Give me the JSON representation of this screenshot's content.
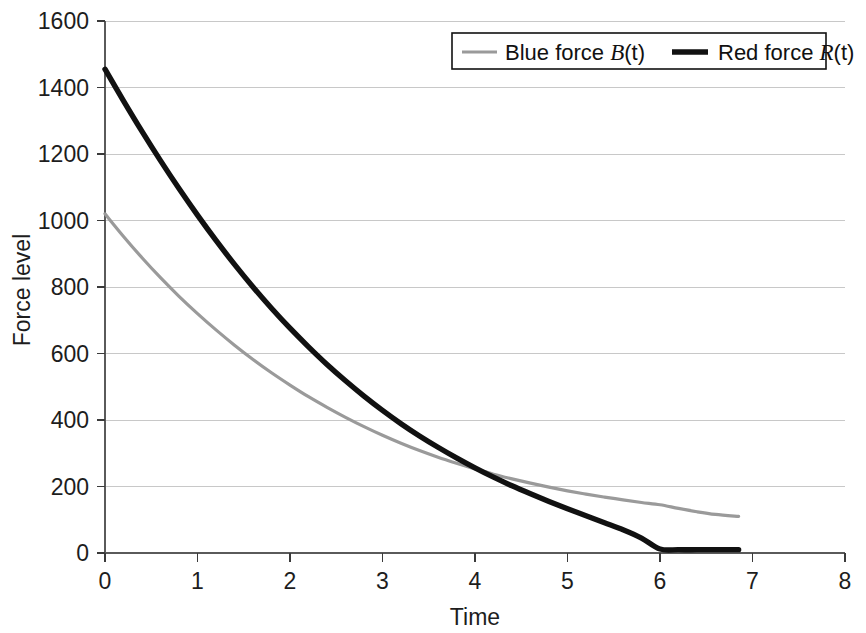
{
  "chart_data": {
    "type": "line",
    "title": "",
    "subtitle": "",
    "xlabel": "Time",
    "ylabel": "Force level",
    "xlim": [
      0,
      8
    ],
    "ylim": [
      0,
      1600
    ],
    "xticks": [
      "0",
      "1",
      "2",
      "3",
      "4",
      "5",
      "6",
      "7",
      "8"
    ],
    "yticks": [
      "0",
      "200",
      "400",
      "600",
      "800",
      "1000",
      "1200",
      "1400",
      "1600"
    ],
    "xtick_values": [
      0,
      1,
      2,
      3,
      4,
      5,
      6,
      7,
      8
    ],
    "ytick_values": [
      0,
      200,
      400,
      600,
      800,
      1000,
      1200,
      1400,
      1600
    ],
    "grid": "horizontal",
    "grid_color": "#c8c8c8",
    "legend_position": "top-right",
    "background": "#ffffff",
    "series": [
      {
        "name": "Blue force B(t)",
        "label_prefix": "Blue force ",
        "label_var": "B",
        "label_suffix": "(t)",
        "color": "#9a9a9a",
        "width": 3.2,
        "x": [
          0,
          0.2,
          0.4,
          0.6,
          0.8,
          1.0,
          1.2,
          1.4,
          1.6,
          1.8,
          2.0,
          2.2,
          2.4,
          2.6,
          2.8,
          3.0,
          3.2,
          3.4,
          3.6,
          3.8,
          4.0,
          4.2,
          4.4,
          4.6,
          4.8,
          5.0,
          5.2,
          5.4,
          5.6,
          5.8,
          6.0,
          6.2,
          6.4,
          6.6,
          6.85
        ],
        "y": [
          1020,
          952,
          888,
          828,
          772,
          720,
          671,
          625,
          582,
          542,
          505,
          470,
          438,
          408,
          380,
          354,
          330,
          308,
          288,
          270,
          253,
          237,
          223,
          210,
          198,
          187,
          177,
          168,
          160,
          152,
          145,
          134,
          124,
          116,
          110
        ]
      },
      {
        "name": "Red force R(t)",
        "label_prefix": "Red force ",
        "label_var": "R",
        "label_suffix": "(t)",
        "color": "#111111",
        "width": 5.4,
        "x": [
          0,
          0.2,
          0.4,
          0.6,
          0.8,
          1.0,
          1.2,
          1.4,
          1.6,
          1.8,
          2.0,
          2.2,
          2.4,
          2.6,
          2.8,
          3.0,
          3.2,
          3.4,
          3.6,
          3.8,
          4.0,
          4.2,
          4.4,
          4.6,
          4.8,
          5.0,
          5.2,
          5.4,
          5.6,
          5.8,
          6.0,
          6.2,
          6.4,
          6.6,
          6.85
        ],
        "y": [
          1455,
          1360,
          1268,
          1180,
          1096,
          1016,
          940,
          868,
          800,
          736,
          676,
          620,
          567,
          518,
          472,
          429,
          389,
          352,
          318,
          286,
          256,
          228,
          202,
          178,
          155,
          133,
          112,
          91,
          70,
          45,
          12,
          10,
          10,
          10,
          10
        ]
      }
    ]
  },
  "legend": {
    "entries": [
      {
        "prefix": "Blue force ",
        "variable": "B",
        "suffix": "(t)"
      },
      {
        "prefix": "Red force ",
        "variable": "R",
        "suffix": "(t)"
      }
    ]
  }
}
